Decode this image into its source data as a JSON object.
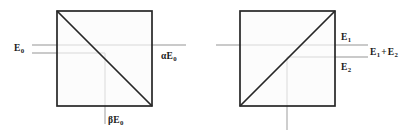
{
  "figure": {
    "background_color": "#ffffff",
    "stroke_color": "#262626",
    "beam_color": "#b3b3b3",
    "text_color": "#1a1a1a"
  },
  "panels": [
    {
      "name": "left-beam-splitter",
      "square": {
        "x": 57,
        "y": 11,
        "size": 95
      },
      "diagonal": "top-left-to-bottom-right",
      "beams": {
        "input_horizontal_y": 45,
        "output_horizontal_y": 53,
        "output_vertical_x": 105
      },
      "labels": {
        "input": {
          "symbol": "E",
          "subscript": "0",
          "text": "E0"
        },
        "transmitted": {
          "prefix": "α",
          "symbol": "E",
          "subscript": "0",
          "text": "αE0"
        },
        "reflected": {
          "prefix": "β",
          "symbol": "E",
          "subscript": "0",
          "text": "βE0"
        }
      }
    },
    {
      "name": "right-beam-combiner",
      "square": {
        "x": 240,
        "y": 11,
        "size": 95
      },
      "diagonal": "bottom-left-to-top-right",
      "beams": {
        "input_upper_y": 45,
        "output_horizontal_y": 57,
        "input_vertical_x": 287
      },
      "labels": {
        "input_one": {
          "symbol": "E",
          "subscript": "1",
          "text": "E1"
        },
        "input_two": {
          "symbol": "E",
          "subscript": "2",
          "text": "E2"
        },
        "output": {
          "text": "E1 + E2",
          "operator": "+"
        }
      }
    }
  ],
  "labels": {
    "e0": {
      "base": "E",
      "sub": "0"
    },
    "alpha_e0": {
      "prefix": "α",
      "base": "E",
      "sub": "0"
    },
    "beta_e0": {
      "prefix": "β",
      "base": "E",
      "sub": "0"
    },
    "e1": {
      "base": "E",
      "sub": "1"
    },
    "e2": {
      "base": "E",
      "sub": "2"
    },
    "e1_plus_e2": {
      "first_base": "E",
      "first_sub": "1",
      "operator": "+",
      "second_base": "E",
      "second_sub": "2"
    }
  }
}
